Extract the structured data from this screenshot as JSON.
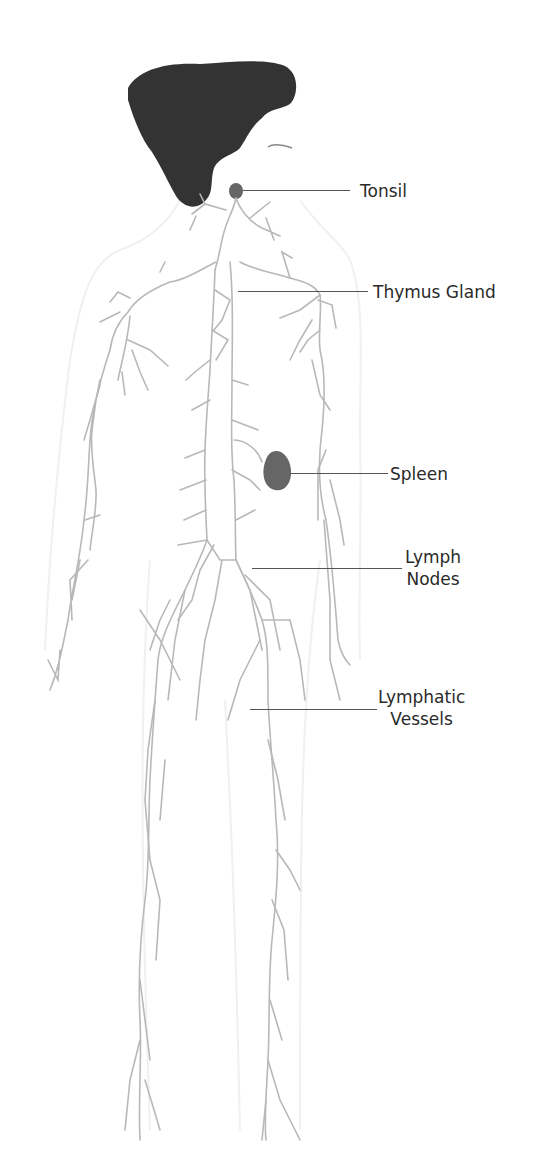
{
  "diagram": {
    "type": "anatomical-diagram",
    "colors": {
      "hair": "#333333",
      "organ": "#666666",
      "vessels": "#b8b8b8",
      "body_outline": "#f2f2f2",
      "leader": "#555555",
      "text": "#2a2a2a"
    },
    "labels": [
      {
        "id": "tonsil",
        "text": "Tonsil"
      },
      {
        "id": "thymus",
        "text": "Thymus Gland"
      },
      {
        "id": "spleen",
        "text": "Spleen"
      },
      {
        "id": "lymph-nodes",
        "line1": "Lymph",
        "line2": "Nodes"
      },
      {
        "id": "lymphatic-vessels",
        "line1": "Lymphatic",
        "line2": "Vessels"
      }
    ]
  }
}
